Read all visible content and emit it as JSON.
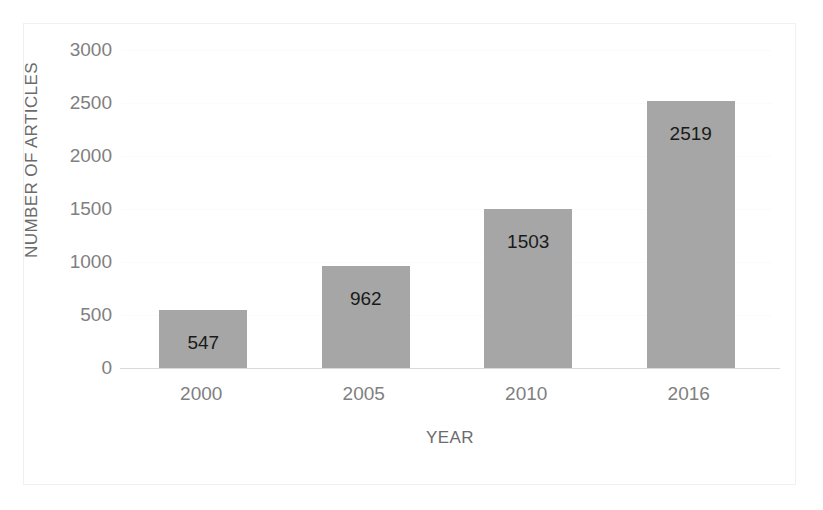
{
  "chart_data": {
    "type": "bar",
    "title": "",
    "subtitle": "",
    "xlabel": "YEAR",
    "ylabel": "NUMBER OF ARTICLES",
    "categories": [
      "2000",
      "2005",
      "2010",
      "2016"
    ],
    "values": [
      547,
      962,
      1503,
      2519
    ],
    "data_labels": [
      "547",
      "962",
      "1503",
      "2519"
    ],
    "ylim": [
      0,
      3000
    ],
    "ytick_labels": [
      "3000",
      "2500",
      "2000",
      "1500",
      "1000",
      "500",
      "0"
    ],
    "ytick_values": [
      3000,
      2500,
      2000,
      1500,
      1000,
      500,
      0
    ],
    "grid": false,
    "legend": null,
    "series": [
      {
        "name": "Number of articles",
        "values": [
          547,
          962,
          1503,
          2519
        ],
        "color": "#a6a6a6"
      }
    ],
    "colors": {
      "bar_fill": "#a6a6a6",
      "axis_line": "#d9d9d9",
      "tick_text": "#808080",
      "axis_title_text": "#6b6b6b",
      "data_label_text": "#1a1a1a",
      "plot_background": "#ffffff",
      "frame_border": "#f0f0f0"
    }
  }
}
